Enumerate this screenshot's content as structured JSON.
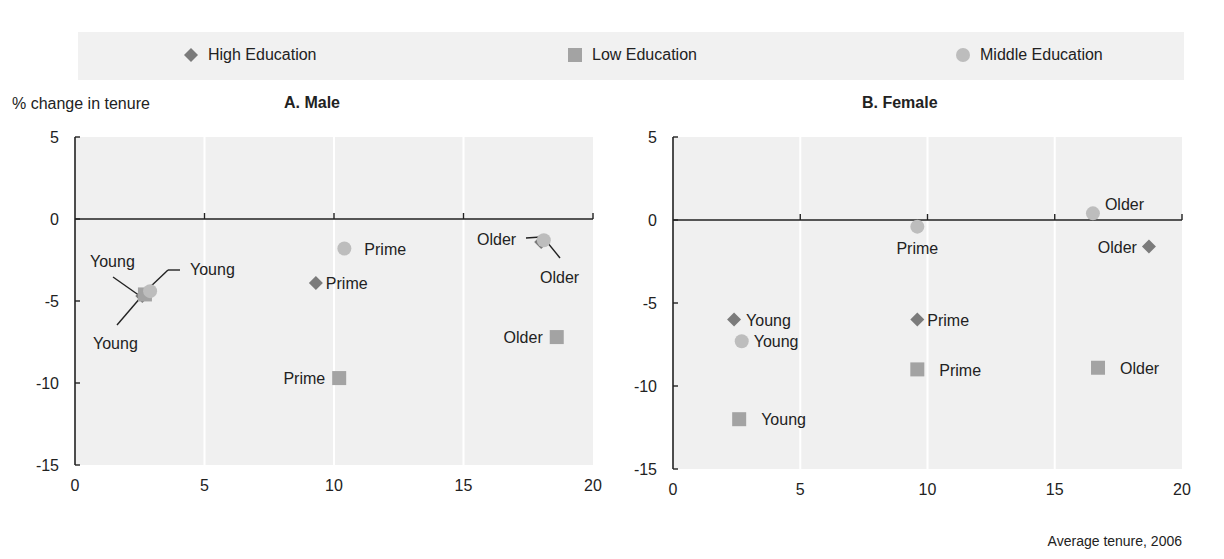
{
  "legend": {
    "items": [
      {
        "label": "High Education",
        "marker": "diamond",
        "color": "#7b7b7b"
      },
      {
        "label": "Low Education",
        "marker": "square",
        "color": "#a3a3a3"
      },
      {
        "label": "Middle Education",
        "marker": "circle",
        "color": "#bdbdbd"
      }
    ]
  },
  "ylabel": "% change in tenure",
  "xlabel": "Average tenure, 2006",
  "panels": [
    {
      "title": "A. Male"
    },
    {
      "title": "B. Female"
    }
  ],
  "chart_data": [
    {
      "type": "scatter",
      "title": "A. Male",
      "xlabel": "Average tenure, 2006",
      "ylabel": "% change in tenure",
      "xlim": [
        0,
        20
      ],
      "ylim": [
        -15,
        5
      ],
      "xticks": [
        0,
        5,
        10,
        15,
        20
      ],
      "yticks": [
        5,
        0,
        -5,
        -10,
        -15
      ],
      "grid": "vertical",
      "legend_position": "top",
      "series": [
        {
          "name": "High Education",
          "marker": "diamond",
          "points": [
            {
              "label": "Young",
              "x": 2.6,
              "y": -4.7
            },
            {
              "label": "Prime",
              "x": 9.3,
              "y": -3.9
            },
            {
              "label": "Older",
              "x": 18.0,
              "y": -1.4
            }
          ]
        },
        {
          "name": "Low Education",
          "marker": "square",
          "points": [
            {
              "label": "Young",
              "x": 2.7,
              "y": -4.6
            },
            {
              "label": "Prime",
              "x": 10.2,
              "y": -9.7
            },
            {
              "label": "Older",
              "x": 18.6,
              "y": -7.2
            }
          ]
        },
        {
          "name": "Middle Education",
          "marker": "circle",
          "points": [
            {
              "label": "Young",
              "x": 2.9,
              "y": -4.4
            },
            {
              "label": "Prime",
              "x": 10.4,
              "y": -1.8
            },
            {
              "label": "Older",
              "x": 18.1,
              "y": -1.3
            }
          ]
        }
      ]
    },
    {
      "type": "scatter",
      "title": "B. Female",
      "xlabel": "Average tenure, 2006",
      "ylabel": "% change in tenure",
      "xlim": [
        0,
        20
      ],
      "ylim": [
        -15,
        5
      ],
      "xticks": [
        0,
        5,
        10,
        15,
        20
      ],
      "yticks": [
        5,
        0,
        -5,
        -10,
        -15
      ],
      "grid": "vertical",
      "legend_position": "top",
      "series": [
        {
          "name": "High Education",
          "marker": "diamond",
          "points": [
            {
              "label": "Young",
              "x": 2.4,
              "y": -6.0
            },
            {
              "label": "Prime",
              "x": 9.6,
              "y": -6.0
            },
            {
              "label": "Older",
              "x": 18.7,
              "y": -1.6
            }
          ]
        },
        {
          "name": "Low Education",
          "marker": "square",
          "points": [
            {
              "label": "Young",
              "x": 2.6,
              "y": -12.0
            },
            {
              "label": "Prime",
              "x": 9.6,
              "y": -9.0
            },
            {
              "label": "Older",
              "x": 16.7,
              "y": -8.9
            }
          ]
        },
        {
          "name": "Middle Education",
          "marker": "circle",
          "points": [
            {
              "label": "Young",
              "x": 2.7,
              "y": -7.3
            },
            {
              "label": "Prime",
              "x": 9.6,
              "y": -0.4
            },
            {
              "label": "Older",
              "x": 16.5,
              "y": 0.4
            }
          ]
        }
      ]
    }
  ]
}
